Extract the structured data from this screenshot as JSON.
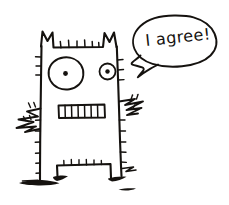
{
  "canvas": {
    "width": 229,
    "height": 205,
    "background_color": "#ffffff",
    "ink_color": "#15120f",
    "style": "hand-drawn black ink doodle on white paper"
  },
  "speech_bubble": {
    "text": "I agree!",
    "shape": "irregular hand-drawn oval with tail pointing down-left",
    "tail_direction": "down-left toward character head"
  },
  "character": {
    "name": "boxy monster",
    "head_top": {
      "ears": [
        "left-pointed-ear",
        "right-pointed-ear"
      ],
      "bristle_count": 7
    },
    "left_eye": {
      "type": "large circle with center dot"
    },
    "right_eye": {
      "type": "small circle with center dot"
    },
    "mouth": {
      "type": "rectangle with vertical teeth lines",
      "teeth": 7
    },
    "left_arm": {
      "type": "zigzag scribble with bristles"
    },
    "right_arm": {
      "type": "zigzag scribble with bristles"
    },
    "legs": {
      "type": "inverted-U outline with bristles along top"
    },
    "ground_shadow": {
      "type": "scribbled ink smudges under feet"
    }
  }
}
